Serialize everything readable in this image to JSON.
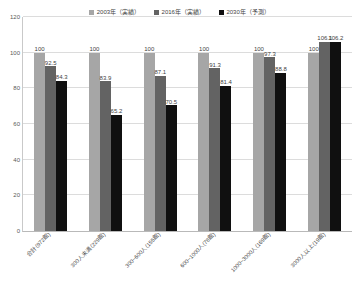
{
  "chart_data": {
    "type": "bar",
    "title": "",
    "subtitle": "",
    "xlabel": "",
    "ylabel": "",
    "ylim": [
      0,
      120
    ],
    "yticks": [
      0,
      20,
      40,
      60,
      80,
      100,
      120
    ],
    "grid": true,
    "legend_position": "top-center",
    "categories": [
      "合計(972館)",
      "300人未満(229館)",
      "300~600人(155館)",
      "600~1000人(78館)",
      "1000~3000人(169館)",
      "3000人以上(19館)"
    ],
    "series": [
      {
        "name": "2003年（実績）",
        "color": "#a6a6a6",
        "values": [
          100,
          100,
          100,
          100,
          100,
          100
        ],
        "labels": [
          "100",
          "100",
          "100",
          "100",
          "100",
          "100"
        ]
      },
      {
        "name": "2016年（実績）",
        "color": "#636363",
        "values": [
          92.5,
          83.9,
          87.1,
          91.3,
          97.3,
          106.1
        ],
        "labels": [
          "92.5",
          "83.9",
          "87.1",
          "91.3",
          "97.3",
          "106.1"
        ]
      },
      {
        "name": "2030年（予測）",
        "color": "#101010",
        "values": [
          84.3,
          65.2,
          70.5,
          81.4,
          88.8,
          106.2
        ],
        "labels": [
          "84.3",
          "65.2",
          "70.5",
          "81.4",
          "88.8",
          "106.2"
        ]
      }
    ]
  },
  "colors": {
    "series_2003": "#a6a6a6",
    "series_2016": "#636363",
    "series_2030": "#101010",
    "gridline": "#dcdcdc",
    "axis": "#b9b9b9",
    "text": "#3f3f3f",
    "background": "#ffffff"
  }
}
